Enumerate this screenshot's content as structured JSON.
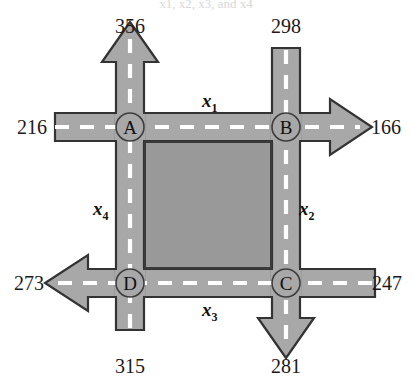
{
  "figure": {
    "type": "traffic-flow-network-diagram",
    "caption_fragment": "x1, x2, x3, and x4",
    "colors": {
      "road_fill": "#a8a8a8",
      "road_edge": "#333333",
      "lane_dash": "#ffffff",
      "block_fill": "#999999",
      "block_edge": "#3a3a3a",
      "background": "#ffffff",
      "text": "#1a1a1a"
    }
  },
  "nodes": [
    {
      "id": "A",
      "label": "A",
      "x": 130,
      "y": 127
    },
    {
      "id": "B",
      "label": "B",
      "x": 286,
      "y": 127
    },
    {
      "id": "C",
      "label": "C",
      "x": 286,
      "y": 283
    },
    {
      "id": "D",
      "label": "D",
      "x": 130,
      "y": 283
    }
  ],
  "external_flows": [
    {
      "id": "flow-north-west",
      "value": "356",
      "node": "A",
      "direction": "out",
      "side": "top",
      "arrow": true,
      "label_x": 130,
      "label_y": 33
    },
    {
      "id": "flow-north-east",
      "value": "298",
      "node": "B",
      "direction": "in",
      "side": "top",
      "arrow": false,
      "label_x": 286,
      "label_y": 33
    },
    {
      "id": "flow-west-top",
      "value": "216",
      "node": "A",
      "direction": "in",
      "side": "left",
      "arrow": false,
      "label_x": 32,
      "label_y": 134
    },
    {
      "id": "flow-east-top",
      "value": "166",
      "node": "B",
      "direction": "out",
      "side": "right",
      "arrow": true,
      "label_x": 385,
      "label_y": 134
    },
    {
      "id": "flow-west-bottom",
      "value": "273",
      "node": "D",
      "direction": "out",
      "side": "left",
      "arrow": true,
      "label_x": 30,
      "label_y": 290
    },
    {
      "id": "flow-east-bottom",
      "value": "247",
      "node": "C",
      "direction": "in",
      "side": "right",
      "arrow": false,
      "label_x": 386,
      "label_y": 290
    },
    {
      "id": "flow-south-west",
      "value": "315",
      "node": "D",
      "direction": "in",
      "side": "bottom",
      "arrow": false,
      "label_x": 130,
      "label_y": 373
    },
    {
      "id": "flow-south-east",
      "value": "281",
      "node": "C",
      "direction": "out",
      "side": "bottom",
      "arrow": true,
      "label_x": 286,
      "label_y": 373
    }
  ],
  "internal_flows": [
    {
      "id": "x1",
      "base": "x",
      "sub": "1",
      "from": "A",
      "to": "B",
      "edge": "top",
      "label_x": 208,
      "label_y": 105
    },
    {
      "id": "x2",
      "base": "x",
      "sub": "2",
      "from": "B",
      "to": "C",
      "edge": "right",
      "label_x": 305,
      "label_y": 212
    },
    {
      "id": "x3",
      "base": "x",
      "sub": "3",
      "from": "D",
      "to": "C",
      "edge": "bottom",
      "label_x": 208,
      "label_y": 312
    },
    {
      "id": "x4",
      "base": "x",
      "sub": "4",
      "from": "A",
      "to": "D",
      "edge": "left",
      "label_x": 100,
      "label_y": 212
    }
  ]
}
